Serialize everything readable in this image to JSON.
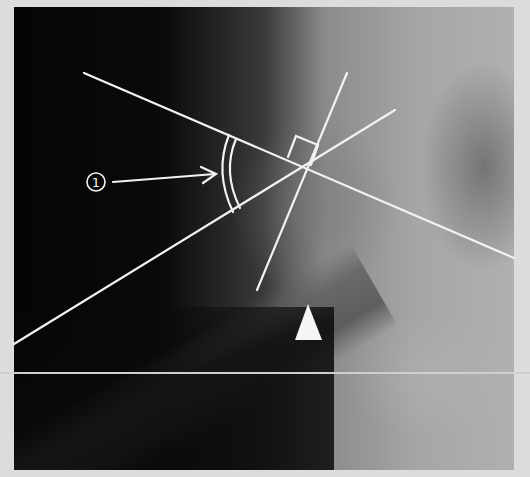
{
  "image": {
    "description": "Hip radiograph with femoral neck-shaft angle measurement overlay",
    "callout_number": "1",
    "annotations": {
      "line_acetabular": "reference line",
      "line_neck_axis": "femoral neck axis",
      "line_perpendicular": "perpendicular line with right-angle marker",
      "angle_arc": "double arc marking measured angle",
      "arrow_marker": "arrowhead triangle"
    },
    "colors": {
      "overlay_line": "#f2f2f2",
      "frame": "#dcdcdc",
      "background_dark": "#050505",
      "bone_light": "#b0b0b0"
    }
  }
}
